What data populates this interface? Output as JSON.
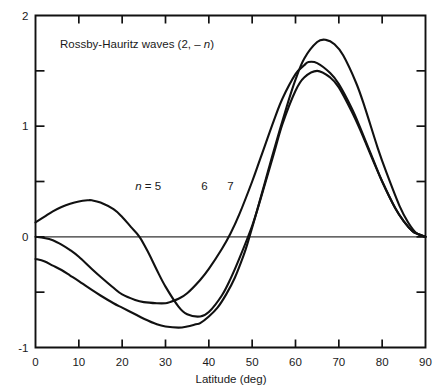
{
  "chart_data": {
    "type": "line",
    "title": "Rossby-Hauritz waves (2, – n)",
    "xlabel": "Latitude (deg)",
    "ylabel": "",
    "xlim": [
      0,
      90
    ],
    "ylim": [
      -1,
      2
    ],
    "xticks": [
      0,
      10,
      20,
      30,
      40,
      50,
      60,
      70,
      80,
      90
    ],
    "xtick_labels": [
      "0",
      "10",
      "20",
      "30",
      "40",
      "50",
      "60",
      "70",
      "80",
      "90"
    ],
    "yticks": [
      -1,
      -0.5,
      0,
      0.5,
      1,
      1.5,
      2
    ],
    "ytick_labels": [
      "-1",
      "",
      "0",
      "",
      "1",
      "",
      "2"
    ],
    "ylabeled_ticks": [
      {
        "value": 2,
        "label": "2"
      },
      {
        "value": 1,
        "label": "1"
      },
      {
        "value": 0,
        "label": "0"
      },
      {
        "value": -1,
        "label": "-1"
      }
    ],
    "yminor_ticks": [
      1.5,
      0.5,
      -0.5
    ],
    "grid": false,
    "legend": "inline-curve-labels",
    "zero_reference_line": true,
    "series": [
      {
        "name": "n = 5",
        "label": "n = 5",
        "label_x": 26,
        "label_y": 0.42,
        "color": "#111111",
        "x": [
          0,
          2,
          4,
          6,
          8,
          10,
          12,
          13,
          15,
          18,
          20,
          22,
          24,
          26,
          28,
          30,
          33,
          35,
          38,
          40,
          43,
          45,
          47,
          50,
          52,
          55,
          57,
          60,
          62,
          65,
          68,
          70,
          73,
          75,
          78,
          80,
          83,
          85,
          87,
          88,
          90
        ],
        "y": [
          0.13,
          0.18,
          0.23,
          0.27,
          0.3,
          0.32,
          0.33,
          0.33,
          0.31,
          0.25,
          0.18,
          0.09,
          0.0,
          -0.14,
          -0.3,
          -0.45,
          -0.63,
          -0.7,
          -0.72,
          -0.68,
          -0.53,
          -0.38,
          -0.2,
          0.1,
          0.35,
          0.75,
          1.02,
          1.32,
          1.44,
          1.5,
          1.44,
          1.35,
          1.13,
          0.96,
          0.68,
          0.5,
          0.26,
          0.14,
          0.05,
          0.03,
          0.0
        ]
      },
      {
        "name": "n = 6",
        "label": "6",
        "label_x": 39,
        "label_y": 0.42,
        "color": "#111111",
        "x": [
          0,
          2,
          4,
          6,
          8,
          10,
          13,
          15,
          18,
          20,
          23,
          25,
          28,
          30,
          31,
          33,
          35,
          38,
          40,
          43,
          45,
          47,
          50,
          52,
          55,
          57,
          60,
          62,
          63,
          65,
          68,
          70,
          73,
          75,
          78,
          80,
          83,
          85,
          87,
          88,
          90
        ],
        "y": [
          0.0,
          -0.01,
          -0.03,
          -0.07,
          -0.12,
          -0.18,
          -0.29,
          -0.36,
          -0.46,
          -0.52,
          -0.57,
          -0.59,
          -0.6,
          -0.6,
          -0.59,
          -0.56,
          -0.51,
          -0.39,
          -0.29,
          -0.11,
          0.03,
          0.2,
          0.5,
          0.72,
          1.05,
          1.25,
          1.47,
          1.55,
          1.58,
          1.57,
          1.48,
          1.38,
          1.16,
          0.98,
          0.69,
          0.5,
          0.26,
          0.14,
          0.05,
          0.03,
          0.0
        ]
      },
      {
        "name": "n = 7",
        "label": "7",
        "label_x": 45,
        "label_y": 0.42,
        "color": "#111111",
        "x": [
          0,
          2,
          4,
          6,
          8,
          10,
          13,
          15,
          18,
          20,
          23,
          25,
          28,
          30,
          33,
          35,
          37,
          38,
          40,
          42,
          44,
          46,
          48,
          49,
          51,
          53,
          55,
          58,
          60,
          62,
          65,
          67,
          69,
          71,
          74,
          76,
          79,
          81,
          84,
          86,
          88,
          90
        ],
        "y": [
          -0.2,
          -0.22,
          -0.26,
          -0.3,
          -0.35,
          -0.4,
          -0.48,
          -0.53,
          -0.6,
          -0.64,
          -0.7,
          -0.74,
          -0.79,
          -0.81,
          -0.82,
          -0.81,
          -0.79,
          -0.78,
          -0.72,
          -0.64,
          -0.52,
          -0.37,
          -0.17,
          -0.05,
          0.22,
          0.5,
          0.78,
          1.18,
          1.42,
          1.61,
          1.76,
          1.78,
          1.74,
          1.64,
          1.39,
          1.17,
          0.8,
          0.58,
          0.28,
          0.13,
          0.03,
          0.0
        ]
      }
    ]
  },
  "figure": {
    "title_text": "Rossby-Hauritz waves (2, – ",
    "title_italic_n": "n",
    "title_close": ")",
    "x_axis_label": "Latitude (deg)",
    "curve_label_n_prefix": "n",
    "curve_label_n_equals": " = 5",
    "curve_label_6": "6",
    "curve_label_7": "7",
    "x_tick_0": "0",
    "x_tick_10": "10",
    "x_tick_20": "20",
    "x_tick_30": "30",
    "x_tick_40": "40",
    "x_tick_50": "50",
    "x_tick_60": "60",
    "x_tick_70": "70",
    "x_tick_80": "80",
    "x_tick_90": "90",
    "y_tick_2": "2",
    "y_tick_1": "1",
    "y_tick_0": "0",
    "y_tick_neg1": "-1",
    "colors": {
      "curve": "#111111",
      "axis": "#111111",
      "background": "#ffffff"
    }
  }
}
